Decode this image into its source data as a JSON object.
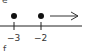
{
  "labels": {
    "top": "e",
    "bottom": "f"
  },
  "number_line": {
    "ticks": [
      "−3",
      "−2"
    ],
    "points": [
      {
        "value": -3,
        "filled": true
      },
      {
        "value": -2,
        "filled": true
      }
    ],
    "arrow_direction": "right"
  }
}
